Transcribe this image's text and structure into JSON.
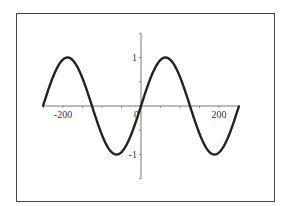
{
  "chart_data": {
    "type": "line",
    "title": "",
    "xlabel": "",
    "ylabel": "",
    "function": "y = sin(x/40)",
    "xlim": [
      -251,
      251
    ],
    "ylim": [
      -1.5,
      1.5
    ],
    "grid": false,
    "legend": null,
    "x_ticks": [
      -200,
      0,
      200
    ],
    "x_tick_labels": [
      "-200",
      "0",
      "200"
    ],
    "y_ticks": [
      1,
      -1
    ],
    "y_tick_labels": [
      "1",
      "-1"
    ],
    "series": [
      {
        "name": "sin",
        "color": "#222222",
        "x": [
          -251,
          -189,
          -126,
          -63,
          0,
          63,
          126,
          189,
          251
        ],
        "values": [
          0,
          1,
          0,
          -1,
          0,
          1,
          0,
          -1,
          0
        ]
      }
    ],
    "annotations": []
  },
  "colors": {
    "curve": "#222222",
    "axes": "#555555",
    "frame": "#444444",
    "background": "#ffffff"
  }
}
